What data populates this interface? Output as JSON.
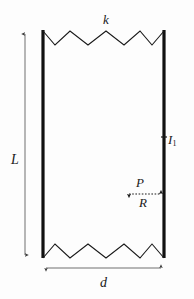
{
  "figure": {
    "background_color": "#fdfdfd",
    "stroke_color": "#1a1a1a",
    "dimension_color": "#4d4d4d",
    "width": 194,
    "height": 299
  },
  "labels": {
    "spring_stiffness": "k",
    "length": "L",
    "moment_of_inertia": "I",
    "moment_of_inertia_sub": "1",
    "load_p": "P",
    "reaction_r": "R",
    "width": "d"
  },
  "geometry": {
    "left_bar": {
      "x": 43,
      "y_top": 30,
      "y_bottom": 258,
      "thickness": 3
    },
    "right_bar": {
      "x": 164,
      "y_top": 30,
      "y_bottom": 258,
      "thickness": 3
    },
    "top_spring": {
      "points": "43,31 55,45 70,31 88,45 106,31 124,45 140,31 152,45 164,31",
      "peaks": 4,
      "y_peak": 31,
      "y_valley": 45
    },
    "bottom_spring": {
      "points": "43,258 55,244 70,258 88,244 106,258 124,244 140,258 152,244 164,258",
      "peaks": 4,
      "y_peak": 244,
      "y_valley": 258
    },
    "length_dimension": {
      "x": 25,
      "y_top": 31,
      "y_bottom": 258
    },
    "width_dimension": {
      "y": 268,
      "x_left": 43,
      "x_right": 164
    },
    "load_arrow": {
      "y": 194,
      "x_left": 126,
      "x_right": 164,
      "style": "dotted-double-headed"
    },
    "inertia_tick": {
      "x": 164,
      "y": 137
    }
  }
}
